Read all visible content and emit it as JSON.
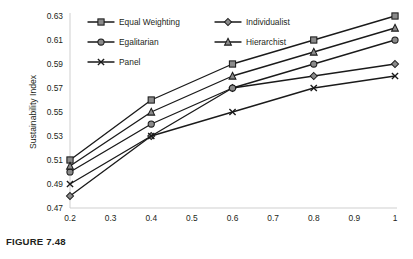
{
  "caption": "FIGURE 7.48",
  "chart_data": {
    "type": "line",
    "title": "",
    "xlabel": "Energy Index",
    "ylabel": "Sustainability Index",
    "x": [
      0.2,
      0.4,
      0.6,
      0.8,
      1.0
    ],
    "xlim": [
      0.2,
      1.0
    ],
    "ylim": [
      0.47,
      0.63
    ],
    "xticks": [
      "0.2",
      "0.3",
      "0.4",
      "0.5",
      "0.6",
      "0.7",
      "0.8",
      "0.9",
      "1"
    ],
    "xtick_values": [
      0.2,
      0.3,
      0.4,
      0.5,
      0.6,
      0.7,
      0.8,
      0.9,
      1.0
    ],
    "yticks": [
      "0.47",
      "0.49",
      "0.51",
      "0.53",
      "0.55",
      "0.57",
      "0.59",
      "0.61",
      "0.63"
    ],
    "ytick_values": [
      0.47,
      0.49,
      0.51,
      0.53,
      0.55,
      0.57,
      0.59,
      0.61,
      0.63
    ],
    "grid": false,
    "legend_position": "top-inside",
    "series": [
      {
        "name": "Equal Weighting",
        "marker": "square",
        "values": [
          0.51,
          0.56,
          0.59,
          0.61,
          0.63
        ]
      },
      {
        "name": "Individualist",
        "marker": "diamond",
        "values": [
          0.48,
          0.53,
          0.57,
          0.58,
          0.59
        ]
      },
      {
        "name": "Egalitarian",
        "marker": "circle",
        "values": [
          0.5,
          0.54,
          0.57,
          0.59,
          0.61
        ]
      },
      {
        "name": "Hierarchist",
        "marker": "triangle",
        "values": [
          0.505,
          0.55,
          0.58,
          0.6,
          0.62
        ]
      },
      {
        "name": "Panel",
        "marker": "cross",
        "values": [
          0.49,
          0.53,
          0.55,
          0.57,
          0.58
        ]
      }
    ]
  }
}
